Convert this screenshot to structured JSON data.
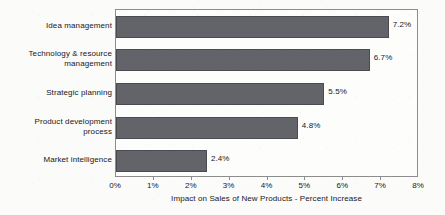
{
  "chart_data": {
    "type": "bar",
    "orientation": "horizontal",
    "title": "",
    "xlabel": "Impact on Sales of New Products - Percent Increase",
    "ylabel": "",
    "xlim": [
      0,
      8
    ],
    "xtick_labels": [
      "0%",
      "1%",
      "2%",
      "3%",
      "4%",
      "5%",
      "6%",
      "7%",
      "8%"
    ],
    "xtick_values": [
      0,
      1,
      2,
      3,
      4,
      5,
      6,
      7,
      8
    ],
    "grid": false,
    "legend": "none",
    "bar_color": "#63636a",
    "categories": [
      "Idea management",
      "Technology & resource\nmanagement",
      "Strategic planning",
      "Product development\nprocess",
      "Market intelligence"
    ],
    "values": [
      7.2,
      6.7,
      5.5,
      4.8,
      2.4
    ],
    "value_labels": [
      "7.2%",
      "6.7%",
      "5.5%",
      "4.8%",
      "2.4%"
    ]
  }
}
